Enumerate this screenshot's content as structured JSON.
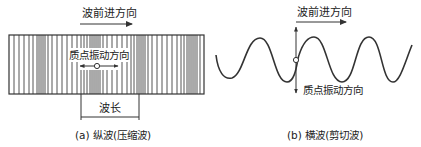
{
  "panel_a": {
    "top_label": "波前进方向",
    "inner_label": "质点振动方向",
    "wavelength_label": "波长",
    "caption": "(a) 纵波(压缩波)",
    "rect": {
      "x": 9,
      "y": 35,
      "w": 195,
      "h": 59
    },
    "lines_x": [
      14,
      19,
      24,
      29,
      33,
      37,
      39,
      41,
      43,
      45,
      48,
      52,
      57,
      62,
      67,
      72,
      77,
      81,
      84,
      87,
      90,
      92,
      94,
      96,
      98,
      100,
      103,
      107,
      112,
      117,
      122,
      127,
      131,
      134,
      137,
      139,
      141,
      143,
      145,
      148,
      152,
      157,
      162,
      167,
      172,
      177,
      181,
      184,
      187,
      189,
      191,
      193,
      195,
      197,
      200
    ]
  },
  "panel_b": {
    "top_label": "波前进方向",
    "side_label": "质点振动方向",
    "caption": "(b) 横波(剪切波)"
  },
  "colors": {
    "stroke": "#333333",
    "line": "#555555",
    "text": "#222222",
    "background": "#ffffff"
  }
}
